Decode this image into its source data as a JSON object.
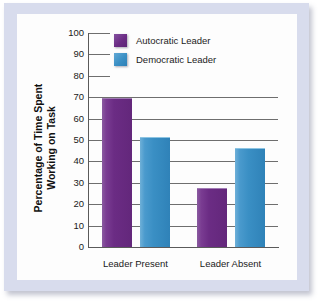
{
  "chart_data": {
    "type": "bar",
    "title": "",
    "xlabel": "",
    "ylabel": "Percentage of Time Spent Working on Task",
    "ylabel_lines": [
      "Percentage of Time Spent",
      "Working on Task"
    ],
    "categories": [
      "Leader Present",
      "Leader Absent"
    ],
    "series": [
      {
        "name": "Autocratic Leader",
        "color": "#6b2c84",
        "values": [
          69,
          27
        ]
      },
      {
        "name": "Democratic Leader",
        "color": "#3a8fc4",
        "values": [
          51,
          46
        ]
      }
    ],
    "ylim": [
      0,
      100
    ],
    "ytick_labels": [
      "100",
      "90",
      "80",
      "70",
      "60",
      "50",
      "40",
      "30",
      "20",
      "10",
      "0"
    ],
    "ytick_values": [
      100,
      90,
      80,
      70,
      60,
      50,
      40,
      30,
      20,
      10,
      0
    ],
    "grid": "horizontal",
    "legend_position": "top-center"
  },
  "colors": {
    "frame": "#d8dced",
    "plot_background": "#fdfdfd",
    "autocratic": "#6b2c84",
    "democratic": "#3a8fc4",
    "gridline": "#6e6e6e",
    "axis": "#5a5a5a",
    "text": "#1a1a1a"
  }
}
